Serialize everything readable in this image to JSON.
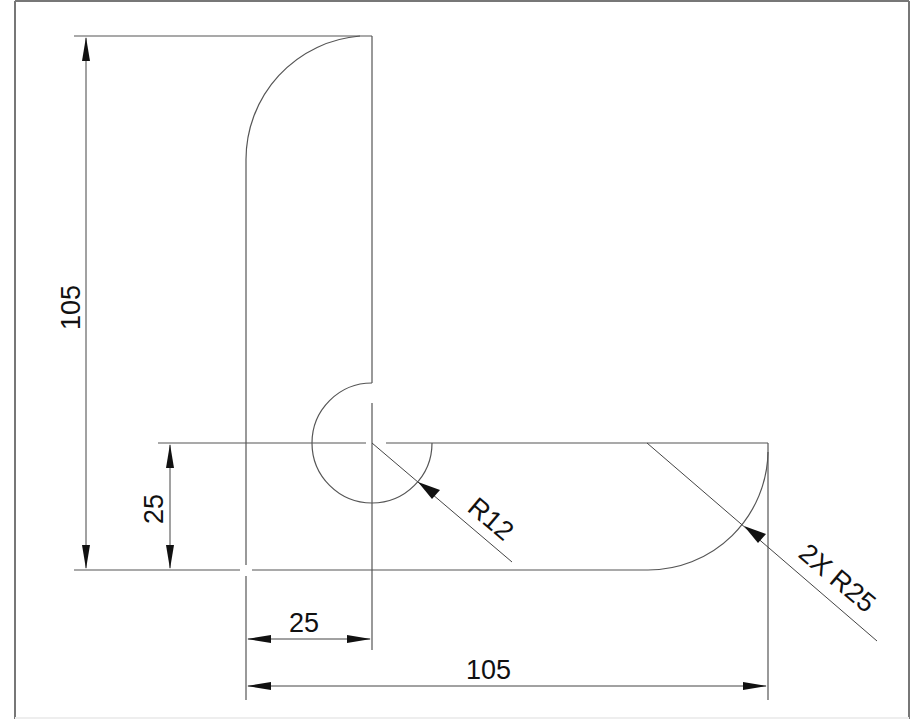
{
  "drawing": {
    "title": "L-bracket technical drawing",
    "units": "mm",
    "dimensions": {
      "overall_height": {
        "label": "105",
        "orientation": "vertical"
      },
      "leg_height": {
        "label": "25",
        "orientation": "vertical"
      },
      "leg_width": {
        "label": "25",
        "orientation": "horizontal"
      },
      "overall_width": {
        "label": "105",
        "orientation": "horizontal"
      },
      "inner_radius": {
        "label": "R12",
        "orientation": "leader"
      },
      "outer_radii": {
        "label": "2X R25",
        "orientation": "leader"
      }
    },
    "colors": {
      "line": "#555555",
      "text": "#111111",
      "background": "#ffffff",
      "frame": "#777777"
    }
  }
}
